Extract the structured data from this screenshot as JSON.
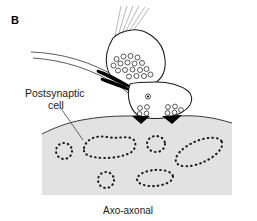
{
  "figure": {
    "panel_letter": "B",
    "caption": "Axo-axonal",
    "annotations": {
      "postsynaptic_line1": "Postsynaptic",
      "postsynaptic_line2": "cell"
    },
    "colors": {
      "background": "#ffffff",
      "cell_fill": "#e2e2e2",
      "cell_stroke": "#333333",
      "terminal_fill": "#ffffff",
      "terminal_stroke": "#1a1a1a",
      "vesicle_stroke": "#333333",
      "active_zone": "#000000",
      "filament_stroke": "#8c8c8c",
      "text": "#1a1a1a",
      "leader_line": "#555555"
    },
    "elements": {
      "presynaptic_terminal_upper": "axon terminal bouton with synaptic vesicles",
      "presynaptic_terminal_lower": "axon terminal with vesicle clusters",
      "incoming_axon": "postsynaptic axon entering from left",
      "postsynaptic_cell": "large shaded cell body with dotted organelle profiles",
      "active_zones": "dark triangular synaptic densities",
      "cytoskeletal_filaments": "thin gray neurofilament lines in terminal neck"
    },
    "vesicles_upper": [
      {
        "cx": 116.5,
        "cy": 59.0,
        "r": 2.5
      },
      {
        "cx": 123.5,
        "cy": 56.5,
        "r": 2.5
      },
      {
        "cx": 130.5,
        "cy": 56.0,
        "r": 2.5
      },
      {
        "cx": 137.5,
        "cy": 57.5,
        "r": 2.5
      },
      {
        "cx": 113.5,
        "cy": 65.5,
        "r": 2.5
      },
      {
        "cx": 120.5,
        "cy": 63.5,
        "r": 2.5
      },
      {
        "cx": 127.5,
        "cy": 62.5,
        "r": 2.5
      },
      {
        "cx": 134.5,
        "cy": 63.5,
        "r": 2.5
      },
      {
        "cx": 142.0,
        "cy": 63.0,
        "r": 2.5
      },
      {
        "cx": 118.0,
        "cy": 70.5,
        "r": 2.5
      },
      {
        "cx": 125.0,
        "cy": 70.0,
        "r": 2.5
      },
      {
        "cx": 132.5,
        "cy": 69.5,
        "r": 2.5
      },
      {
        "cx": 140.0,
        "cy": 70.0,
        "r": 2.5
      },
      {
        "cx": 146.5,
        "cy": 69.0,
        "r": 2.5
      },
      {
        "cx": 129.0,
        "cy": 76.5,
        "r": 2.5
      },
      {
        "cx": 136.5,
        "cy": 76.0,
        "r": 2.5
      },
      {
        "cx": 144.0,
        "cy": 76.0,
        "r": 2.5
      },
      {
        "cx": 150.5,
        "cy": 74.5,
        "r": 2.5
      }
    ],
    "vesicles_lower_left": [
      {
        "cx": 140.0,
        "cy": 108.0,
        "r": 2.4
      },
      {
        "cx": 147.0,
        "cy": 107.0,
        "r": 2.4
      },
      {
        "cx": 139.5,
        "cy": 114.0,
        "r": 2.4
      },
      {
        "cx": 146.5,
        "cy": 113.5,
        "r": 2.4
      }
    ],
    "vesicles_lower_right": [
      {
        "cx": 168.0,
        "cy": 107.0,
        "r": 2.4
      },
      {
        "cx": 175.0,
        "cy": 106.5,
        "r": 2.4
      },
      {
        "cx": 167.5,
        "cy": 113.0,
        "r": 2.4
      },
      {
        "cx": 174.5,
        "cy": 112.5,
        "r": 2.4
      },
      {
        "cx": 181.0,
        "cy": 110.0,
        "r": 2.4
      }
    ],
    "dense_core_vesicle": {
      "cx": 148.0,
      "cy": 96.5,
      "r": 2.4
    },
    "organelle_profiles": [
      {
        "name": "small-circle-left",
        "type": "ellipse",
        "cx": 64,
        "cy": 151,
        "rx": 8,
        "ry": 8,
        "rot": 0,
        "dots": 11
      },
      {
        "name": "large-bean-upper-left",
        "type": "ellipse",
        "cx": 109,
        "cy": 146,
        "rx": 26,
        "ry": 11,
        "rot": -6,
        "dots": 26
      },
      {
        "name": "small-circle-center",
        "type": "ellipse",
        "cx": 156,
        "cy": 144,
        "rx": 9,
        "ry": 8,
        "rot": 0,
        "dots": 12
      },
      {
        "name": "large-ellipse-right",
        "type": "ellipse",
        "cx": 199,
        "cy": 152,
        "rx": 24,
        "ry": 11,
        "rot": -22,
        "dots": 25
      },
      {
        "name": "small-circle-lower",
        "type": "ellipse",
        "cx": 106,
        "cy": 180,
        "rx": 8,
        "ry": 8,
        "rot": 0,
        "dots": 11
      },
      {
        "name": "ellipse-lower-center",
        "type": "ellipse",
        "cx": 155,
        "cy": 178,
        "rx": 18,
        "ry": 8,
        "rot": -4,
        "dots": 19
      }
    ]
  }
}
